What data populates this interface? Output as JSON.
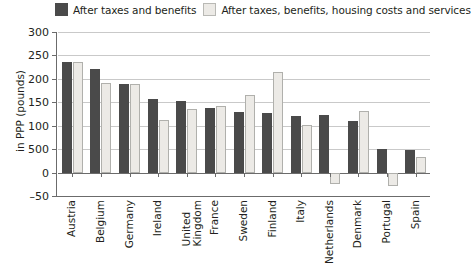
{
  "chart_data": {
    "type": "bar",
    "title": "",
    "xlabel": "",
    "ylabel": "in PPP (pounds)",
    "ylim": [
      -50,
      300
    ],
    "yticks": [
      300,
      250,
      200,
      150,
      100,
      50,
      0,
      -50
    ],
    "ytick_labels": [
      "300",
      "250",
      "200",
      "150",
      "100",
      "500",
      "0",
      "–50"
    ],
    "grid": true,
    "legend_position": "top",
    "categories": [
      "Austria",
      "Belgium",
      "Germany",
      "Ireland",
      "United\nKingdom",
      "France",
      "Sweden",
      "Finland",
      "Italy",
      "Netherlands",
      "Denmark",
      "Portugal",
      "Spain"
    ],
    "series": [
      {
        "name": "After taxes and benefits",
        "color": "#4a4a4a",
        "values": [
          237,
          220,
          188,
          157,
          153,
          138,
          129,
          127,
          120,
          123,
          110,
          51,
          48
        ]
      },
      {
        "name": "After taxes, benefits, housing costs and services",
        "color": "#eceae6",
        "values": [
          235,
          192,
          188,
          112,
          135,
          143,
          165,
          215,
          101,
          -24,
          131,
          -28,
          34
        ]
      }
    ]
  },
  "legend": {
    "items": [
      {
        "label": "After taxes and benefits",
        "swatch": "dark"
      },
      {
        "label": "After taxes, benefits, housing costs and services",
        "swatch": "light"
      }
    ]
  },
  "colors": {
    "series_dark": "#4a4a4a",
    "series_light": "#eceae6",
    "grid": "#c9c9c9",
    "axis": "#6b6b6b",
    "text": "#231f20"
  }
}
